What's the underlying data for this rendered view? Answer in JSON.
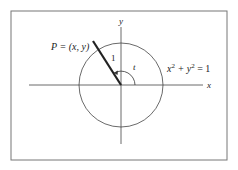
{
  "figure": {
    "frame": {
      "x": 11,
      "y": 11,
      "width": 216,
      "height": 149,
      "color": "#666666"
    },
    "axes": {
      "origin": {
        "x": 121,
        "y": 85
      },
      "x_axis": {
        "from": 29,
        "to": 203,
        "label": "x"
      },
      "y_axis": {
        "from": 27,
        "to": 144,
        "label": "y"
      }
    },
    "circle": {
      "cx": 121,
      "cy": 85,
      "r": 42,
      "equation_lhs": "x",
      "sup1": "2",
      "plus": " + y",
      "sup2": "2",
      "rhs": " = 1"
    },
    "radius_segment": {
      "x1": 121,
      "y1": 85,
      "x2": 93,
      "y2": 41,
      "label": "1"
    },
    "point": {
      "label": "P = (x, y)"
    },
    "angle": {
      "label": "t"
    },
    "colors": {
      "line": "#333333",
      "thick": "#222222"
    }
  }
}
